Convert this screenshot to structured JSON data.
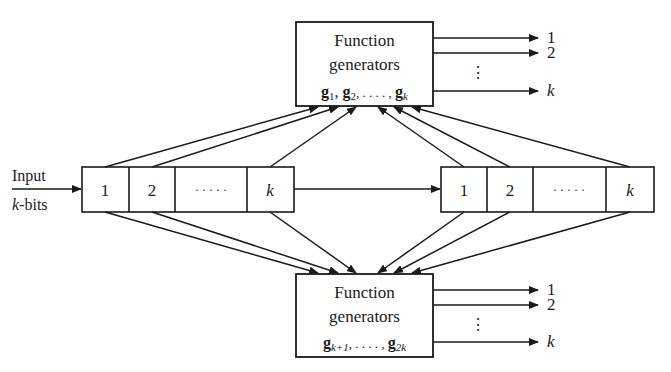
{
  "input_label": {
    "line1": "Input",
    "line2_k": "k",
    "line2_rest": "-bits"
  },
  "top_box": {
    "line1": "Function",
    "line2": "generators",
    "formula": {
      "g1": "g",
      "g1_sub": "1",
      "sep1": ", ",
      "g2": "g",
      "g2_sub": "2",
      "dots": ", . . . . , ",
      "gk": "g",
      "gk_sub": "k"
    }
  },
  "bottom_box": {
    "line1": "Function",
    "line2": "generators",
    "formula": {
      "ga": "g",
      "ga_sub": "k+1",
      "dots": ", . . . . , ",
      "gb": "g",
      "gb_sub": "2k"
    }
  },
  "left_register": {
    "cells": [
      "1",
      "2",
      "· · · · ·",
      "k"
    ]
  },
  "right_register": {
    "cells": [
      "1",
      "2",
      "· · · · ·",
      "k"
    ]
  },
  "top_outputs": {
    "o1": "1",
    "o2": "2",
    "ok": "k",
    "vdots": "⋮"
  },
  "bottom_outputs": {
    "o1": "1",
    "o2": "2",
    "ok": "k",
    "vdots": "⋮"
  },
  "colors": {
    "stroke": "#1a1a1a",
    "background": "#ffffff"
  }
}
